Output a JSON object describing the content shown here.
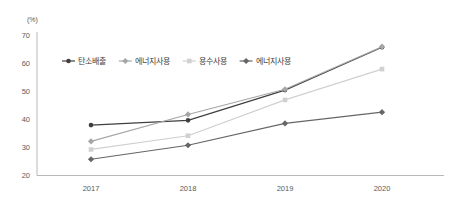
{
  "chart_data": {
    "type": "line",
    "title": "",
    "subtitle": "",
    "xlabel": "",
    "ylabel": "",
    "unit_label": "(%)",
    "categories": [
      "2017",
      "2018",
      "2019",
      "2020"
    ],
    "x": [
      2017,
      2018,
      2019,
      2020
    ],
    "ylim": [
      20,
      70
    ],
    "yticks": [
      20,
      30,
      40,
      50,
      60,
      70
    ],
    "ytick_labels": [
      "20",
      "30",
      "40",
      "50",
      "60",
      "70"
    ],
    "grid": false,
    "legend_position": "top-left-inside",
    "series": [
      {
        "name": "탄소배출",
        "values": [
          38.0,
          39.7,
          50.5,
          65.8
        ],
        "color": "#3f3f3f",
        "marker": "circle"
      },
      {
        "name": "에너지사용",
        "values": [
          32.2,
          41.8,
          50.8,
          66.0
        ],
        "color": "#a6a6a6",
        "marker": "diamond"
      },
      {
        "name": "용수사용",
        "values": [
          29.3,
          34.2,
          47.0,
          58.0
        ],
        "color": "#d0d0d0",
        "marker": "square"
      },
      {
        "name": "에너지사용",
        "values": [
          25.8,
          30.8,
          38.6,
          42.6
        ],
        "color": "#666666",
        "marker": "diamond"
      }
    ]
  },
  "colors": {
    "axis": "#a6a6a6",
    "tick_text": "#5a5a5a",
    "legend_text": "#404040",
    "background": "#ffffff"
  },
  "legend": {
    "items": [
      {
        "label": "탄소배출"
      },
      {
        "label": "에너지사용"
      },
      {
        "label": "용수사용"
      },
      {
        "label": "에너지사용"
      }
    ]
  },
  "axes": {
    "unit": "(%)",
    "y_ticks": [
      "70",
      "60",
      "50",
      "40",
      "30",
      "20"
    ],
    "x_ticks": [
      "2017",
      "2018",
      "2019",
      "2020"
    ]
  }
}
